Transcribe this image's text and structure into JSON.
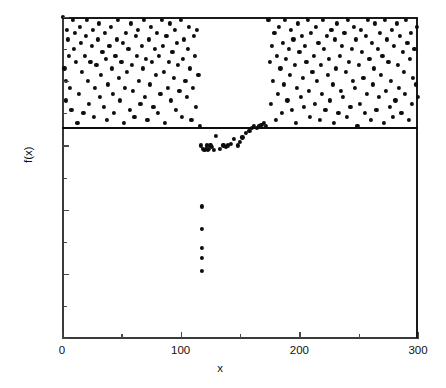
{
  "chart_data": {
    "type": "scatter",
    "title": "",
    "subtitle": "",
    "xlabel": "x",
    "ylabel": "f(x)",
    "xlim": [
      0,
      300
    ],
    "ylim": [
      0.0,
      1.0
    ],
    "grid": false,
    "legend": null,
    "x_ticks": [
      0,
      100,
      200,
      300
    ],
    "x_tick_labels": [
      "0",
      "100",
      "200",
      "300"
    ],
    "x_minor_ticks": [
      50,
      150,
      250
    ],
    "y_ticks": [
      0.0,
      0.2,
      0.4,
      0.6,
      0.8,
      1.0
    ],
    "y_tick_labels": [
      "0.0",
      "0.2",
      "0.4",
      "0.6",
      "0.8",
      "1.0"
    ],
    "y_minor_ticks": [
      0.1,
      0.3,
      0.5,
      0.7,
      0.9
    ],
    "marker": "filled-circle",
    "marker_color": "#0d0d0d",
    "marker_size": 4,
    "annotations": [
      {
        "type": "hline",
        "y": 0.655,
        "color": "#0d0d0d",
        "label": ""
      }
    ],
    "series": [
      {
        "name": "f(x)",
        "points": [
          [
            1,
            1.0
          ],
          [
            2,
            0.84
          ],
          [
            3,
            0.74
          ],
          [
            3,
            0.8
          ],
          [
            4,
            0.96
          ],
          [
            5,
            0.93
          ],
          [
            6,
            0.88
          ],
          [
            7,
            0.78
          ],
          [
            8,
            0.71
          ],
          [
            9,
            0.99
          ],
          [
            10,
            0.9
          ],
          [
            11,
            0.95
          ],
          [
            12,
            0.86
          ],
          [
            13,
            0.67
          ],
          [
            14,
            0.76
          ],
          [
            15,
            0.97
          ],
          [
            16,
            0.92
          ],
          [
            17,
            0.83
          ],
          [
            18,
            0.7
          ],
          [
            19,
            0.88
          ],
          [
            20,
            0.94
          ],
          [
            21,
            0.99
          ],
          [
            22,
            0.8
          ],
          [
            23,
            0.73
          ],
          [
            24,
            0.86
          ],
          [
            25,
            0.91
          ],
          [
            26,
            0.96
          ],
          [
            27,
            0.69
          ],
          [
            28,
            0.78
          ],
          [
            29,
            0.85
          ],
          [
            30,
            0.93
          ],
          [
            31,
            0.98
          ],
          [
            32,
            0.75
          ],
          [
            33,
            0.82
          ],
          [
            34,
            0.89
          ],
          [
            35,
            0.72
          ],
          [
            36,
            0.95
          ],
          [
            37,
            0.87
          ],
          [
            38,
            0.68
          ],
          [
            39,
            0.79
          ],
          [
            40,
            0.91
          ],
          [
            41,
            0.97
          ],
          [
            42,
            0.84
          ],
          [
            43,
            0.76
          ],
          [
            44,
            0.7
          ],
          [
            45,
            0.88
          ],
          [
            46,
            0.93
          ],
          [
            47,
            0.99
          ],
          [
            48,
            0.81
          ],
          [
            49,
            0.74
          ],
          [
            50,
            0.86
          ],
          [
            51,
            0.92
          ],
          [
            52,
            0.67
          ],
          [
            53,
            0.78
          ],
          [
            54,
            0.95
          ],
          [
            55,
            0.83
          ],
          [
            56,
            0.9
          ],
          [
            57,
            0.71
          ],
          [
            58,
            0.98
          ],
          [
            59,
            0.85
          ],
          [
            60,
            0.77
          ],
          [
            61,
            0.69
          ],
          [
            62,
            0.94
          ],
          [
            63,
            0.88
          ],
          [
            64,
            0.96
          ],
          [
            65,
            0.8
          ],
          [
            66,
            0.73
          ],
          [
            67,
            0.91
          ],
          [
            68,
            0.84
          ],
          [
            69,
            0.99
          ],
          [
            70,
            0.75
          ],
          [
            71,
            0.87
          ],
          [
            72,
            0.68
          ],
          [
            73,
            0.93
          ],
          [
            74,
            0.79
          ],
          [
            75,
            0.97
          ],
          [
            76,
            0.86
          ],
          [
            77,
            0.72
          ],
          [
            78,
            0.9
          ],
          [
            79,
            0.82
          ],
          [
            80,
            0.95
          ],
          [
            81,
            0.7
          ],
          [
            82,
            0.88
          ],
          [
            83,
            0.76
          ],
          [
            84,
            0.99
          ],
          [
            85,
            0.91
          ],
          [
            86,
            0.83
          ],
          [
            87,
            0.67
          ],
          [
            88,
            0.94
          ],
          [
            89,
            0.78
          ],
          [
            90,
            0.86
          ],
          [
            91,
            0.98
          ],
          [
            92,
            0.74
          ],
          [
            93,
            0.89
          ],
          [
            94,
            0.81
          ],
          [
            95,
            0.96
          ],
          [
            96,
            0.71
          ],
          [
            97,
            0.92
          ],
          [
            98,
            0.85
          ],
          [
            99,
            0.77
          ],
          [
            100,
            0.99
          ],
          [
            101,
            0.69
          ],
          [
            102,
            0.87
          ],
          [
            103,
            0.93
          ],
          [
            104,
            0.8
          ],
          [
            105,
            0.75
          ],
          [
            106,
            0.9
          ],
          [
            107,
            0.97
          ],
          [
            108,
            0.84
          ],
          [
            109,
            0.68
          ],
          [
            110,
            0.78
          ],
          [
            111,
            0.94
          ],
          [
            112,
            0.88
          ],
          [
            113,
            0.72
          ],
          [
            114,
            0.96
          ],
          [
            115,
            0.82
          ],
          [
            116,
            0.66
          ],
          [
            117,
            0.6
          ],
          [
            118,
            0.41
          ],
          [
            118,
            0.34
          ],
          [
            118,
            0.28
          ],
          [
            118,
            0.25
          ],
          [
            118,
            0.21
          ],
          [
            119,
            0.59
          ],
          [
            120,
            0.585
          ],
          [
            121,
            0.59
          ],
          [
            122,
            0.6
          ],
          [
            123,
            0.585
          ],
          [
            124,
            0.59
          ],
          [
            125,
            0.6
          ],
          [
            126,
            0.595
          ],
          [
            128,
            0.585
          ],
          [
            130,
            0.63
          ],
          [
            133,
            0.59
          ],
          [
            136,
            0.6
          ],
          [
            138,
            0.595
          ],
          [
            140,
            0.6
          ],
          [
            142,
            0.605
          ],
          [
            145,
            0.62
          ],
          [
            148,
            0.6
          ],
          [
            150,
            0.61
          ],
          [
            152,
            0.625
          ],
          [
            155,
            0.64
          ],
          [
            158,
            0.645
          ],
          [
            160,
            0.655
          ],
          [
            162,
            0.66
          ],
          [
            164,
            0.655
          ],
          [
            166,
            0.66
          ],
          [
            168,
            0.665
          ],
          [
            170,
            0.67
          ],
          [
            172,
            0.66
          ],
          [
            174,
            0.99
          ],
          [
            175,
            0.86
          ],
          [
            176,
            0.73
          ],
          [
            177,
            0.91
          ],
          [
            178,
            0.8
          ],
          [
            179,
            0.95
          ],
          [
            180,
            0.68
          ],
          [
            181,
            0.88
          ],
          [
            182,
            0.76
          ],
          [
            183,
            0.97
          ],
          [
            184,
            0.84
          ],
          [
            185,
            0.7
          ],
          [
            186,
            0.92
          ],
          [
            187,
            0.79
          ],
          [
            188,
            0.99
          ],
          [
            189,
            0.87
          ],
          [
            190,
            0.74
          ],
          [
            191,
            0.9
          ],
          [
            192,
            0.82
          ],
          [
            193,
            0.96
          ],
          [
            194,
            0.71
          ],
          [
            195,
            0.93
          ],
          [
            196,
            0.85
          ],
          [
            197,
            0.67
          ],
          [
            198,
            0.78
          ],
          [
            199,
            0.98
          ],
          [
            200,
            0.89
          ],
          [
            201,
            0.75
          ],
          [
            202,
            0.94
          ],
          [
            203,
            0.81
          ],
          [
            204,
            0.72
          ],
          [
            205,
            0.91
          ],
          [
            206,
            0.86
          ],
          [
            207,
            0.99
          ],
          [
            208,
            0.77
          ],
          [
            209,
            0.69
          ],
          [
            210,
            0.95
          ],
          [
            211,
            0.83
          ],
          [
            212,
            0.88
          ],
          [
            213,
            0.73
          ],
          [
            214,
            0.97
          ],
          [
            215,
            0.8
          ],
          [
            216,
            0.92
          ],
          [
            217,
            0.68
          ],
          [
            218,
            0.85
          ],
          [
            219,
            0.76
          ],
          [
            220,
            0.99
          ],
          [
            221,
            0.9
          ],
          [
            222,
            0.71
          ],
          [
            223,
            0.94
          ],
          [
            224,
            0.82
          ],
          [
            225,
            0.87
          ],
          [
            226,
            0.74
          ],
          [
            227,
            0.96
          ],
          [
            228,
            0.79
          ],
          [
            229,
            0.67
          ],
          [
            230,
            0.93
          ],
          [
            231,
            0.84
          ],
          [
            232,
            0.98
          ],
          [
            233,
            0.7
          ],
          [
            234,
            0.88
          ],
          [
            235,
            0.77
          ],
          [
            236,
            0.91
          ],
          [
            237,
            0.75
          ],
          [
            238,
            0.95
          ],
          [
            239,
            0.83
          ],
          [
            240,
            0.69
          ],
          [
            241,
            0.99
          ],
          [
            242,
            0.86
          ],
          [
            243,
            0.72
          ],
          [
            244,
            0.9
          ],
          [
            245,
            0.8
          ],
          [
            246,
            0.97
          ],
          [
            247,
            0.78
          ],
          [
            248,
            0.93
          ],
          [
            249,
            0.66
          ],
          [
            250,
            0.85
          ],
          [
            251,
            0.73
          ],
          [
            252,
            0.96
          ],
          [
            253,
            0.89
          ],
          [
            254,
            0.81
          ],
          [
            255,
            0.7
          ],
          [
            256,
            0.94
          ],
          [
            257,
            0.76
          ],
          [
            258,
            0.99
          ],
          [
            259,
            0.87
          ],
          [
            260,
            0.68
          ],
          [
            261,
            0.92
          ],
          [
            262,
            0.79
          ],
          [
            263,
            0.84
          ],
          [
            264,
            0.98
          ],
          [
            265,
            0.71
          ],
          [
            266,
            0.9
          ],
          [
            267,
            0.75
          ],
          [
            268,
            0.95
          ],
          [
            269,
            0.82
          ],
          [
            270,
            0.88
          ],
          [
            271,
            0.67
          ],
          [
            272,
            0.99
          ],
          [
            273,
            0.77
          ],
          [
            274,
            0.93
          ],
          [
            275,
            0.86
          ],
          [
            276,
            0.72
          ],
          [
            277,
            0.8
          ],
          [
            278,
            0.96
          ],
          [
            279,
            0.69
          ],
          [
            280,
            0.91
          ],
          [
            281,
            0.74
          ],
          [
            282,
            0.98
          ],
          [
            283,
            0.85
          ],
          [
            284,
            0.78
          ],
          [
            285,
            0.94
          ],
          [
            286,
            0.7
          ],
          [
            287,
            0.89
          ],
          [
            288,
            0.83
          ],
          [
            289,
            0.76
          ],
          [
            290,
            0.99
          ],
          [
            291,
            0.92
          ],
          [
            292,
            0.68
          ],
          [
            293,
            0.87
          ],
          [
            294,
            0.95
          ],
          [
            295,
            0.73
          ],
          [
            296,
            0.81
          ],
          [
            297,
            0.9
          ],
          [
            298,
            0.79
          ],
          [
            299,
            0.97
          ],
          [
            300,
            0.75
          ]
        ]
      }
    ]
  }
}
